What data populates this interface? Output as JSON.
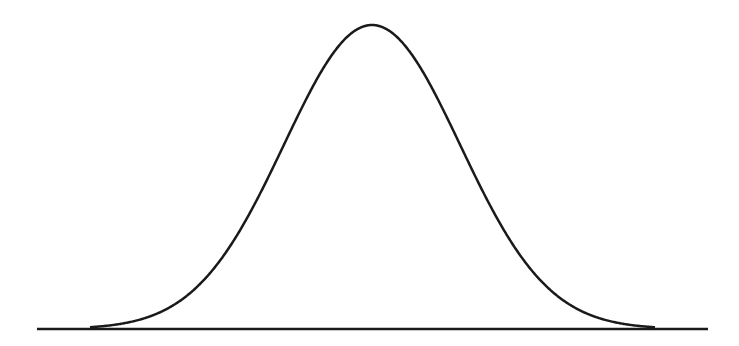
{
  "diagram": {
    "type": "normal-distribution-curve",
    "stroke_color": "#1a1a1a",
    "baseline": {
      "x1": 37,
      "x2": 708,
      "y": 329
    },
    "curve": {
      "center_x": 372,
      "peak_y": 25,
      "sigma_px": 88,
      "x_start": 90,
      "x_end": 655
    }
  }
}
